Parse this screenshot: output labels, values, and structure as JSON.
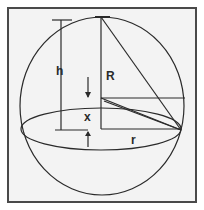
{
  "diagram": {
    "background": "#f3f3f3",
    "frame_color": "#4a4a4a",
    "stroke_color": "#2a2a2a",
    "labels": {
      "h": "h",
      "R": "R",
      "x": "x",
      "r": "r"
    }
  }
}
